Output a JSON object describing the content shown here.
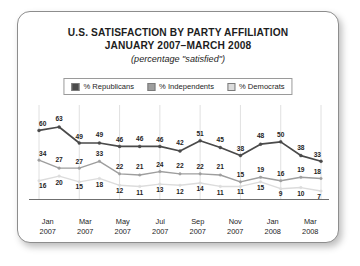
{
  "card": {
    "title_line1": "U.S. SATISFACTION BY PARTY AFFILIATION",
    "title_line2": "JANUARY 2007–MARCH 2008",
    "subtitle": "(percentage \"satisfied\")"
  },
  "legend": {
    "items": [
      {
        "label": "% Republicans",
        "color": "#4a4a4a"
      },
      {
        "label": "% Independents",
        "color": "#9e9e9e"
      },
      {
        "label": "% Democrats",
        "color": "#dcdcdc"
      }
    ]
  },
  "chart_data": {
    "type": "line",
    "title": "U.S. SATISFACTION BY PARTY AFFILIATION JANUARY 2007–MARCH 2008",
    "subtitle": "(percentage \"satisfied\")",
    "xlabel": "",
    "ylabel": "",
    "ylim": [
      0,
      70
    ],
    "grid": "vertical",
    "legend_position": "top",
    "x": [
      "Jan 2007",
      "Feb 2007",
      "Mar 2007",
      "Apr 2007",
      "May 2007",
      "Jun 2007",
      "Jul 2007",
      "Aug 2007",
      "Sep 2007",
      "Oct 2007",
      "Nov 2007",
      "Dec 2007",
      "Jan 2008",
      "Feb 2008",
      "Mar 2008"
    ],
    "tick_labels": [
      "Jan\n2007",
      "Mar\n2007",
      "May\n2007",
      "Jul\n2007",
      "Sep\n2007",
      "Nov\n2007",
      "Jan\n2008",
      "Mar\n2008"
    ],
    "series": [
      {
        "name": "% Republicans",
        "color": "#4a4a4a",
        "values": [
          60,
          63,
          49,
          49,
          46,
          46,
          46,
          42,
          51,
          45,
          38,
          48,
          50,
          38,
          33
        ]
      },
      {
        "name": "% Independents",
        "color": "#9e9e9e",
        "values": [
          34,
          27,
          27,
          33,
          22,
          21,
          24,
          22,
          22,
          21,
          15,
          19,
          16,
          19,
          18
        ]
      },
      {
        "name": "% Democrats",
        "color": "#dcdcdc",
        "values": [
          16,
          20,
          15,
          18,
          12,
          11,
          13,
          12,
          14,
          11,
          11,
          15,
          9,
          10,
          7
        ]
      }
    ]
  },
  "xaxis": {
    "ticks": [
      {
        "month": "Jan",
        "year": "2007"
      },
      {
        "month": "Mar",
        "year": "2007"
      },
      {
        "month": "May",
        "year": "2007"
      },
      {
        "month": "Jul",
        "year": "2007"
      },
      {
        "month": "Sep",
        "year": "2007"
      },
      {
        "month": "Nov",
        "year": "2007"
      },
      {
        "month": "Jan",
        "year": "2008"
      },
      {
        "month": "Mar",
        "year": "2008"
      }
    ]
  }
}
